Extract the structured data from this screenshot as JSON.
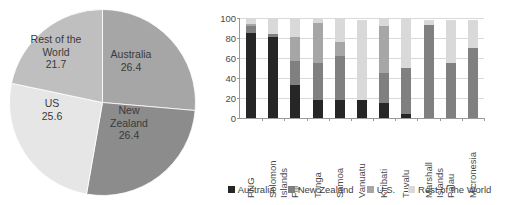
{
  "chart_data": [
    {
      "type": "pie",
      "title": "",
      "labels": [
        "Australia",
        "New Zealand",
        "US",
        "Rest of the World"
      ],
      "values": [
        26.4,
        26.4,
        25.6,
        21.7
      ],
      "value_labels": [
        "26.4",
        "26.4",
        "25.6",
        "21.7"
      ],
      "label_lines": [
        "Australia\n26.4",
        "New\nZealand\n26.4",
        "US\n25.6",
        "Rest of the\nWorld\n21.7"
      ],
      "colors": [
        "#a6a6a6",
        "#8c8c8c",
        "#e6e6e6",
        "#bfbfbf"
      ],
      "start_angle_deg": 0,
      "direction": "clockwise",
      "legend": "none",
      "units": "percent_share"
    },
    {
      "type": "bar",
      "subtype": "stacked",
      "title": "",
      "xlabel": "",
      "ylabel": "",
      "ylim": [
        0,
        100
      ],
      "yticks": [
        0,
        20,
        40,
        60,
        80,
        100
      ],
      "grid": true,
      "legend_position": "bottom",
      "categories": [
        "PNG",
        "Solomon Islands",
        "Fiji",
        "Tonga",
        "Samoa",
        "Vanuatu",
        "Kiribati",
        "Tuvalu",
        "Marshall Islands",
        "Palau",
        "Micronesia"
      ],
      "category_label_lines": [
        "PNG",
        "Solomon\nIslands",
        "Fiji",
        "Tonga",
        "Samoa",
        "Vanuatu",
        "Kiribati",
        "Tuvalu",
        "Marshall\nIslands",
        "Palau",
        "Micronesia"
      ],
      "series": [
        {
          "name": "Australia",
          "color": "#262626",
          "values": [
            85,
            81,
            33,
            18,
            18,
            18,
            15,
            4,
            0,
            0,
            0
          ]
        },
        {
          "name": "New Zealand",
          "color": "#808080",
          "values": [
            7,
            3,
            24,
            37,
            44,
            0,
            30,
            46,
            93,
            55,
            70
          ]
        },
        {
          "name": "U.S.",
          "color": "#a6a6a6",
          "values": [
            2,
            0,
            24,
            40,
            14,
            0,
            47,
            0,
            0,
            0,
            0
          ]
        },
        {
          "name": "Rest of the World",
          "color": "#d9d9d9",
          "values": [
            6,
            16,
            19,
            5,
            24,
            80,
            8,
            50,
            5,
            43,
            28
          ]
        }
      ]
    }
  ],
  "legend": {
    "items": [
      {
        "label": "Australia",
        "color": "#262626"
      },
      {
        "label": "New Zealand",
        "color": "#808080"
      },
      {
        "label": "U.S.",
        "color": "#a6a6a6"
      },
      {
        "label": "Rest of the World",
        "color": "#d9d9d9"
      }
    ]
  }
}
